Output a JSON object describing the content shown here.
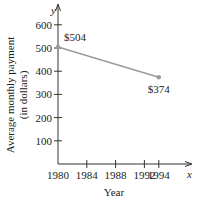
{
  "chart_data": {
    "type": "line",
    "title": "",
    "xlabel": "Year",
    "ylabel": "Average monthly payment (in dollars)",
    "ylabel_lines": [
      "Average monthly payment",
      "(in dollars)"
    ],
    "x_axis_letter": "x",
    "y_axis_letter": "y",
    "x_ticks": [
      1980,
      1984,
      1988,
      1992,
      1994
    ],
    "y_ticks": [
      100,
      200,
      300,
      400,
      500,
      600
    ],
    "xlim": [
      1980,
      1996.5
    ],
    "ylim": [
      0,
      650
    ],
    "grid": false,
    "legend": null,
    "series": [
      {
        "name": "Average monthly payment",
        "x": [
          1980,
          1994
        ],
        "y": [
          504,
          374
        ],
        "color": "#9a9a9a"
      }
    ],
    "annotations": [
      {
        "x": 1980,
        "y": 504,
        "text": "$504"
      },
      {
        "x": 1994,
        "y": 374,
        "text": "$374"
      }
    ]
  }
}
